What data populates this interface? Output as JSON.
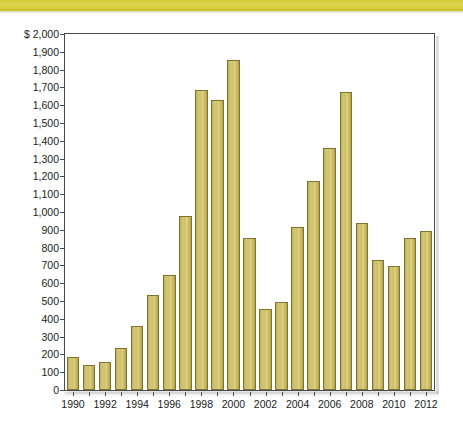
{
  "banner": {
    "color": "#d8cf40"
  },
  "chart_data": {
    "type": "bar",
    "title": "",
    "subtitle": "",
    "xlabel": "",
    "ylabel": "",
    "y_axis_prefix": "$",
    "ylim": [
      0,
      2000
    ],
    "ytick_step": 100,
    "ytick_labels": [
      "$ 2,000",
      "1,900",
      "1,800",
      "1,700",
      "1,600",
      "1,500",
      "1,400",
      "1,300",
      "1,200",
      "1,100",
      "1,000",
      "900",
      "800",
      "700",
      "600",
      "500",
      "400",
      "300",
      "200",
      "100",
      "0"
    ],
    "ytick_values": [
      2000,
      1900,
      1800,
      1700,
      1600,
      1500,
      1400,
      1300,
      1200,
      1100,
      1000,
      900,
      800,
      700,
      600,
      500,
      400,
      300,
      200,
      100,
      0
    ],
    "xtick_labels": [
      "1990",
      "1992",
      "1994",
      "1996",
      "1998",
      "2000",
      "2002",
      "2004",
      "2006",
      "2008",
      "2010",
      "2012"
    ],
    "grid": false,
    "legend": false,
    "bar_color": "#cfc167",
    "bar_edge_color": "#7d7434",
    "categories": [
      "1990",
      "1991",
      "1992",
      "1993",
      "1994",
      "1995",
      "1996",
      "1997",
      "1998",
      "1999",
      "2000",
      "2001",
      "2002",
      "2003",
      "2004",
      "2005",
      "2006",
      "2007",
      "2008",
      "2009",
      "2010",
      "2011",
      "2012"
    ],
    "values": [
      185,
      140,
      158,
      238,
      357,
      533,
      648,
      975,
      1685,
      1632,
      1855,
      855,
      455,
      495,
      915,
      1175,
      1358,
      1672,
      940,
      730,
      695,
      855,
      893
    ]
  }
}
